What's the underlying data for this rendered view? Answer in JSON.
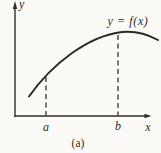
{
  "figure": {
    "y_axis_label": "y",
    "x_axis_label": "x",
    "curve_label": "y = f(x)",
    "point_a_label": "a",
    "point_b_label": "b",
    "caption": "(a)"
  },
  "colors": {
    "background": "#fbfaf7",
    "ink": "#2b2a28"
  }
}
